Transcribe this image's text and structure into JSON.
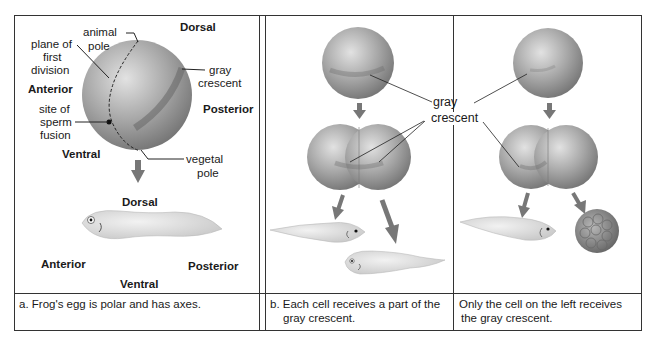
{
  "panel_a": {
    "labels": {
      "animal_pole": "animal\npole",
      "animal": "animal",
      "pole": "pole",
      "plane_line1": "plane of",
      "plane_line2": "first",
      "plane_line3": "division",
      "dorsal": "Dorsal",
      "gray": "gray",
      "crescent": "crescent",
      "anterior": "Anterior",
      "posterior": "Posterior",
      "site_line1": "site of",
      "site_line2": "sperm",
      "site_line3": "fusion",
      "ventral": "Ventral",
      "vegetal": "vegetal",
      "vegetal_pole": "pole",
      "tadpole_dorsal": "Dorsal",
      "tadpole_anterior": "Anterior",
      "tadpole_posterior": "Posterior",
      "tadpole_ventral": "Ventral"
    },
    "caption": "a. Frog's egg is polar and has axes."
  },
  "shared": {
    "gray": "gray",
    "crescent": "crescent"
  },
  "panel_b": {
    "caption_line1": "b. Each cell receives a part of the",
    "caption_line2": "gray crescent."
  },
  "panel_c": {
    "caption_line1": "Only the cell on the left receives",
    "caption_line2": "the gray crescent."
  },
  "colors": {
    "border": "#333333",
    "egg": "#9a9a9a",
    "egg_highlight": "#d8d8d8",
    "crescent": "#6e6e6e",
    "tadpole": "#dedede",
    "arrow": "#7a7a7a"
  }
}
